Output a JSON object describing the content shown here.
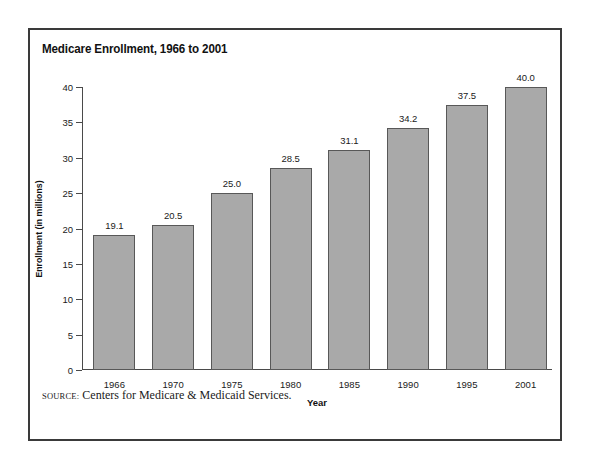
{
  "figure": {
    "title": "Medicare Enrollment, 1966 to 2001",
    "source_label": "Source:",
    "source_text": "Centers for Medicare & Medicaid Services.",
    "border_color": "#3a3a3a",
    "background_color": "#ffffff"
  },
  "chart_data": {
    "type": "bar",
    "title": "Medicare Enrollment, 1966 to 2001",
    "xlabel": "Year",
    "ylabel": "Enrollment (in millions)",
    "categories": [
      "1966",
      "1970",
      "1975",
      "1980",
      "1985",
      "1990",
      "1995",
      "2001"
    ],
    "values": [
      19.1,
      20.5,
      25.0,
      28.5,
      31.1,
      34.2,
      37.5,
      40.0
    ],
    "value_labels": [
      "19.1",
      "20.5",
      "25.0",
      "28.5",
      "31.1",
      "34.2",
      "37.5",
      "40.0"
    ],
    "ylim": [
      0,
      40
    ],
    "ytick_values": [
      0,
      5,
      10,
      15,
      20,
      25,
      30,
      35,
      40
    ],
    "ytick_labels": [
      "0",
      "5",
      "10",
      "15",
      "20",
      "25",
      "30",
      "35",
      "40"
    ],
    "grid": false,
    "legend": null,
    "bar_fill_color": "#a9a9a9",
    "bar_edge_color": "#585858",
    "axis_color": "#4a4a4a"
  }
}
